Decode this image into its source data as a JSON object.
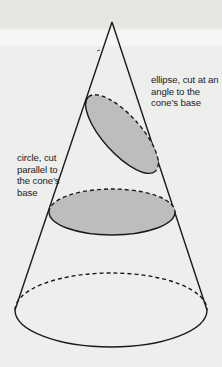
{
  "figure": {
    "type": "conic-sections-diagram",
    "subject": "cone",
    "colors": {
      "background": "#eeeeec",
      "stroke": "#1a1a1a",
      "fill_section": "#bdbdbb"
    }
  },
  "labels": {
    "ellipse": {
      "lines": [
        "ellipse, cut at an",
        "angle to the",
        "cone’s base"
      ]
    },
    "circle": {
      "lines": [
        "circle, cut",
        "parallel to",
        "the cone’s",
        "base"
      ]
    }
  },
  "shapes": {
    "apex": [
      112,
      22
    ],
    "tilted_ellipse": {
      "cx": 122,
      "cy": 134,
      "rx": 48,
      "ry": 20,
      "rotate": 48
    },
    "circle_section": {
      "cx": 112,
      "cy": 212,
      "rx": 63,
      "ry": 23
    },
    "base": {
      "cx": 111,
      "cy": 310,
      "rx": 96,
      "ry": 37
    }
  }
}
